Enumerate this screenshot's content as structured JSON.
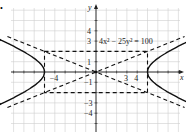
{
  "marker": "•",
  "chart_data": {
    "type": "line",
    "title": "4x² − 25y² = 100",
    "xlabel": "x",
    "ylabel": "y",
    "grid": true,
    "x_tick_labels": [
      "−4",
      "3",
      "4"
    ],
    "y_tick_labels": [
      "4",
      "3",
      "1",
      "−1",
      "−3",
      "−4"
    ],
    "xlim": [
      -9,
      9
    ],
    "ylim": [
      -6,
      6
    ],
    "series": [
      {
        "name": "hyperbola right branch",
        "style": "solid",
        "description": "x = 5*sqrt(1 + y^2/4), vertex (5,0)"
      },
      {
        "name": "hyperbola left branch",
        "style": "solid",
        "description": "x = -5*sqrt(1 + y^2/4), vertex (-5,0)"
      },
      {
        "name": "asymptote",
        "style": "dashed",
        "equation": "y = 2/5 x"
      },
      {
        "name": "asymptote",
        "style": "dashed",
        "equation": "y = -2/5 x"
      },
      {
        "name": "fundamental rectangle",
        "style": "dashed",
        "corners": [
          [
            -5,
            2
          ],
          [
            5,
            2
          ],
          [
            5,
            -2
          ],
          [
            -5,
            -2
          ]
        ]
      }
    ],
    "vertices": [
      [
        -5,
        0
      ],
      [
        5,
        0
      ]
    ]
  }
}
